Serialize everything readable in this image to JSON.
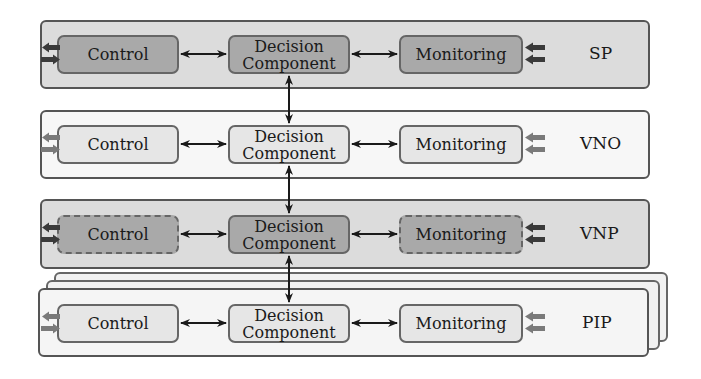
{
  "diagram": {
    "layers": [
      {
        "id": "sp",
        "label": "SP",
        "style": "dark",
        "control": {
          "label": "Control",
          "border": "solid"
        },
        "decision": {
          "line1": "Decision",
          "line2": "Component",
          "border": "solid"
        },
        "monitoring": {
          "label": "Monitoring",
          "border": "solid"
        }
      },
      {
        "id": "vno",
        "label": "VNO",
        "style": "light",
        "control": {
          "label": "Control",
          "border": "solid"
        },
        "decision": {
          "line1": "Decision",
          "line2": "Component",
          "border": "solid"
        },
        "monitoring": {
          "label": "Monitoring",
          "border": "solid"
        }
      },
      {
        "id": "vnp",
        "label": "VNP",
        "style": "dark",
        "control": {
          "label": "Control",
          "border": "dashed"
        },
        "decision": {
          "line1": "Decision",
          "line2": "Component",
          "border": "solid"
        },
        "monitoring": {
          "label": "Monitoring",
          "border": "dashed"
        }
      },
      {
        "id": "pip",
        "label": "PIP",
        "style": "light",
        "stacked": 3,
        "control": {
          "label": "Control",
          "border": "solid"
        },
        "decision": {
          "line1": "Decision",
          "line2": "Component",
          "border": "solid"
        },
        "monitoring": {
          "label": "Monitoring",
          "border": "solid"
        }
      }
    ],
    "colors": {
      "dark_layer_fill": "#dcdcdc",
      "dark_box_fill": "#a9a9a9",
      "light_layer_fill": "#f7f7f7",
      "light_box_fill": "#e6e6e6",
      "border": "#555555",
      "arrow": "#1a1a1a",
      "io_arrow_dark": "#3a3a3a",
      "io_arrow_light": "#7a7a7a"
    }
  }
}
